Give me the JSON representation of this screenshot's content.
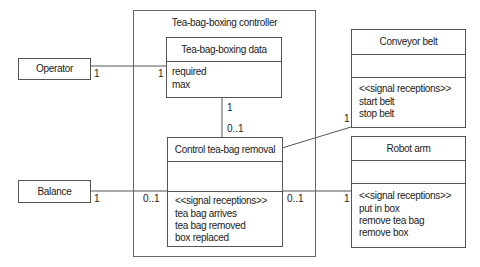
{
  "diagram": {
    "type": "UML class / context diagram",
    "controller": {
      "title": "Tea-bag-boxing controller"
    },
    "data_class": {
      "name": "Tea-bag-boxing data",
      "attributes": [
        "required",
        "max"
      ]
    },
    "control_class": {
      "name": "Control tea-bag removal",
      "stereotype": "<<signal receptions>>",
      "signals": [
        "tea bag arrives",
        "tea bag removed",
        "box replaced"
      ]
    },
    "actors": {
      "operator": {
        "name": "Operator"
      },
      "balance": {
        "name": "Balance"
      }
    },
    "conveyor_belt": {
      "name": "Conveyor belt",
      "stereotype": "<<signal receptions>>",
      "signals": [
        "start belt",
        "stop belt"
      ]
    },
    "robot_arm": {
      "name": "Robot arm",
      "stereotype": "<<signal receptions>>",
      "signals": [
        "put in box",
        "remove tea bag",
        "remove box"
      ]
    },
    "multiplicities": {
      "operator_end": "1",
      "data_operator_end": "1",
      "data_control_end": "1",
      "control_data_end": "0..1",
      "balance_end": "1",
      "control_balance_end": "0..1",
      "control_robot_end": "0..1",
      "robot_end": "1",
      "conveyor_end": "1"
    },
    "colors": {
      "line": "#555555",
      "frame": "#666666",
      "background": "#ffffff",
      "text": "#222222"
    }
  }
}
